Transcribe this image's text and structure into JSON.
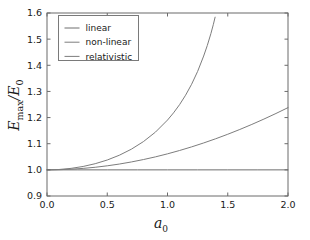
{
  "figure": {
    "background": "#ffffff",
    "axes_color": "#6b6b6b",
    "text_color": "#1a1a1a"
  },
  "chart_data": {
    "type": "line",
    "title": "",
    "xlabel": "a_0",
    "xlabel_base": "a",
    "xlabel_sub": "0",
    "ylabel": "E_max/E_0",
    "ylabel_E1": "E",
    "ylabel_sub1": "max",
    "ylabel_slash": "/",
    "ylabel_E2": "E",
    "ylabel_sub2": "0",
    "xlim": [
      0.0,
      2.0
    ],
    "ylim": [
      0.9,
      1.6
    ],
    "xticks": [
      0.0,
      0.5,
      1.0,
      1.5,
      2.0
    ],
    "xtick_labels": [
      "0.0",
      "0.5",
      "1.0",
      "1.5",
      "2.0"
    ],
    "yticks": [
      0.9,
      1.0,
      1.1,
      1.2,
      1.3,
      1.4,
      1.5,
      1.6
    ],
    "ytick_labels": [
      "0.9",
      "1.0",
      "1.1",
      "1.2",
      "1.3",
      "1.4",
      "1.5",
      "1.6"
    ],
    "grid": false,
    "legend_position": "upper left",
    "series": [
      {
        "name": "linear",
        "color": "#6e6e6e",
        "x": [
          0.0,
          0.25,
          0.5,
          0.75,
          1.0,
          1.25,
          1.5,
          1.75,
          2.0
        ],
        "values": [
          1.0,
          1.0,
          1.0,
          1.0,
          1.0,
          1.0,
          1.0,
          1.0,
          1.0
        ]
      },
      {
        "name": "non-linear",
        "color": "#7d7d7d",
        "x": [
          0.0,
          0.1,
          0.2,
          0.3,
          0.4,
          0.5,
          0.6,
          0.7,
          0.8,
          0.9,
          1.0,
          1.1,
          1.2,
          1.3,
          1.4,
          1.5,
          1.6,
          1.7,
          1.8,
          1.9,
          2.0
        ],
        "values": [
          1.0,
          1.0006,
          1.0025,
          1.0056,
          1.0099,
          1.0155,
          1.0222,
          1.0302,
          1.0394,
          1.0497,
          1.0613,
          1.074,
          1.0879,
          1.1029,
          1.119,
          1.1362,
          1.1545,
          1.1738,
          1.1942,
          1.2156,
          1.238
        ]
      },
      {
        "name": "relativistic",
        "color": "#7d7d7d",
        "x": [
          0.0,
          0.1,
          0.2,
          0.3,
          0.4,
          0.5,
          0.6,
          0.7,
          0.8,
          0.9,
          1.0,
          1.05,
          1.1,
          1.15,
          1.2,
          1.25,
          1.3,
          1.33,
          1.36,
          1.38,
          1.395
        ],
        "values": [
          1.0,
          1.0014,
          1.0057,
          1.013,
          1.0236,
          1.0377,
          1.0559,
          1.079,
          1.108,
          1.1444,
          1.1905,
          1.218,
          1.2494,
          1.2855,
          1.3274,
          1.3766,
          1.4353,
          1.4755,
          1.5211,
          1.5552,
          1.584
        ]
      }
    ]
  },
  "legend": {
    "entries": [
      {
        "label": "linear",
        "color": "#6e6e6e"
      },
      {
        "label": "non-linear",
        "color": "#7d7d7d"
      },
      {
        "label": "relativistic",
        "color": "#7d7d7d"
      }
    ]
  }
}
